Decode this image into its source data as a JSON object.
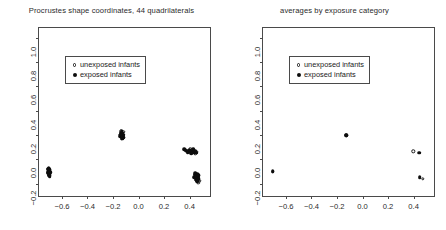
{
  "figure": {
    "background": "#ffffff",
    "foreground": "#1a1a1a"
  },
  "panels": [
    {
      "id": "left",
      "title": "Procrustes shape coordinates, 44 quadrilaterals",
      "legend": {
        "position": "upper-left",
        "entries": [
          {
            "label": "unexposed infants",
            "marker": "open-circle",
            "color": "#1a1a1a"
          },
          {
            "label": "exposed infants",
            "marker": "filled-circle",
            "color": "#0d0d0d"
          }
        ]
      }
    },
    {
      "id": "right",
      "title": "averages by exposure category",
      "legend": {
        "position": "upper-left",
        "entries": [
          {
            "label": "unexposed infants",
            "marker": "open-circle",
            "color": "#1a1a1a"
          },
          {
            "label": "exposed infants",
            "marker": "filled-circle",
            "color": "#0d0d0d"
          }
        ]
      }
    }
  ],
  "chart_data": [
    {
      "type": "scatter",
      "title": "Procrustes shape coordinates, 44 quadrilaterals",
      "xlabel": "",
      "ylabel": "",
      "xlim": [
        -0.78,
        0.56
      ],
      "ylim": [
        -0.3,
        1.08
      ],
      "xticks": [
        -0.6,
        -0.4,
        -0.2,
        0.0,
        0.2,
        0.4
      ],
      "xticklabels": [
        "-0.6",
        "-0.4",
        "-0.2",
        "0.0",
        "0.2",
        "0.4"
      ],
      "yticks": [
        -0.2,
        0.0,
        0.2,
        0.4,
        0.6,
        0.8,
        1.0
      ],
      "yticklabels": [
        "-0.2",
        "0.0",
        "0.2",
        "0.4",
        "0.6",
        "0.8",
        "1.0"
      ],
      "grid": false,
      "aspect": "equal",
      "legend_position": "upper-left",
      "series": [
        {
          "name": "unexposed infants",
          "marker": "open-circle",
          "color": "#1a1a1a",
          "points": [
            [
              -0.705,
              -0.09
            ],
            [
              -0.7,
              -0.104
            ],
            [
              -0.696,
              -0.118
            ],
            [
              -0.709,
              -0.075
            ],
            [
              -0.702,
              -0.131
            ],
            [
              -0.698,
              -0.098
            ],
            [
              -0.707,
              -0.112
            ],
            [
              -0.694,
              -0.084
            ],
            [
              -0.133,
              0.212
            ],
            [
              -0.126,
              0.198
            ],
            [
              -0.14,
              0.186
            ],
            [
              -0.12,
              0.225
            ],
            [
              -0.131,
              0.17
            ],
            [
              -0.145,
              0.205
            ],
            [
              -0.118,
              0.18
            ],
            [
              -0.137,
              0.232
            ],
            [
              0.368,
              0.078
            ],
            [
              0.392,
              0.068
            ],
            [
              0.42,
              0.06
            ],
            [
              0.445,
              0.052
            ],
            [
              0.405,
              0.084
            ],
            [
              0.43,
              0.072
            ],
            [
              0.38,
              0.062
            ],
            [
              0.455,
              0.065
            ],
            [
              0.455,
              -0.118
            ],
            [
              0.47,
              -0.132
            ],
            [
              0.462,
              -0.16
            ],
            [
              0.448,
              -0.148
            ],
            [
              0.476,
              -0.175
            ],
            [
              0.44,
              -0.126
            ],
            [
              0.468,
              -0.19
            ],
            [
              0.452,
              -0.168
            ]
          ]
        },
        {
          "name": "exposed infants",
          "marker": "filled-circle",
          "color": "#0d0d0d",
          "points": [
            [
              -0.702,
              -0.082
            ],
            [
              -0.699,
              -0.095
            ],
            [
              -0.706,
              -0.108
            ],
            [
              -0.695,
              -0.122
            ],
            [
              -0.703,
              -0.07
            ],
            [
              -0.71,
              -0.1
            ],
            [
              -0.697,
              -0.135
            ],
            [
              -0.704,
              -0.09
            ],
            [
              -0.7,
              -0.115
            ],
            [
              -0.708,
              -0.078
            ],
            [
              -0.693,
              -0.105
            ],
            [
              -0.701,
              -0.128
            ],
            [
              -0.129,
              0.196
            ],
            [
              -0.135,
              0.208
            ],
            [
              -0.122,
              0.184
            ],
            [
              -0.141,
              0.221
            ],
            [
              -0.127,
              0.172
            ],
            [
              -0.133,
              0.23
            ],
            [
              -0.119,
              0.202
            ],
            [
              -0.144,
              0.19
            ],
            [
              -0.13,
              0.215
            ],
            [
              -0.124,
              0.178
            ],
            [
              -0.138,
              0.199
            ],
            [
              -0.132,
              0.188
            ],
            [
              0.36,
              0.082
            ],
            [
              0.375,
              0.072
            ],
            [
              0.39,
              0.066
            ],
            [
              0.408,
              0.058
            ],
            [
              0.422,
              0.07
            ],
            [
              0.436,
              0.062
            ],
            [
              0.45,
              0.055
            ],
            [
              0.4,
              0.078
            ],
            [
              0.415,
              0.05
            ],
            [
              0.43,
              0.084
            ],
            [
              0.444,
              0.068
            ],
            [
              0.385,
              0.056
            ],
            [
              0.442,
              -0.124
            ],
            [
              0.455,
              -0.138
            ],
            [
              0.466,
              -0.152
            ],
            [
              0.449,
              -0.166
            ],
            [
              0.472,
              -0.13
            ],
            [
              0.438,
              -0.145
            ],
            [
              0.46,
              -0.178
            ],
            [
              0.446,
              -0.112
            ],
            [
              0.468,
              -0.16
            ],
            [
              0.452,
              -0.135
            ],
            [
              0.463,
              -0.12
            ],
            [
              0.457,
              -0.172
            ]
          ]
        }
      ]
    },
    {
      "type": "scatter",
      "title": "averages by exposure category",
      "xlabel": "",
      "ylabel": "",
      "xlim": [
        -0.78,
        0.56
      ],
      "ylim": [
        -0.3,
        1.08
      ],
      "xticks": [
        -0.6,
        -0.4,
        -0.2,
        0.0,
        0.2,
        0.4
      ],
      "xticklabels": [
        "-0.6",
        "-0.4",
        "-0.2",
        "0.0",
        "0.2",
        "0.4"
      ],
      "yticks": [
        -0.2,
        0.0,
        0.2,
        0.4,
        0.6,
        0.8,
        1.0
      ],
      "yticklabels": [
        "-0.2",
        "0.0",
        "0.2",
        "0.4",
        "0.6",
        "0.8",
        "1.0"
      ],
      "grid": false,
      "aspect": "equal",
      "legend_position": "upper-left",
      "series": [
        {
          "name": "unexposed infants",
          "marker": "open-circle",
          "color": "#1a1a1a",
          "points": [
            [
              -0.702,
              -0.1
            ],
            [
              -0.128,
              0.199
            ],
            [
              0.398,
              0.066
            ],
            [
              0.47,
              -0.16
            ]
          ]
        },
        {
          "name": "exposed infants",
          "marker": "filled-circle",
          "color": "#0d0d0d",
          "points": [
            [
              -0.704,
              -0.098
            ],
            [
              -0.126,
              0.197
            ],
            [
              0.442,
              0.054
            ],
            [
              0.448,
              -0.144
            ]
          ]
        }
      ]
    }
  ]
}
